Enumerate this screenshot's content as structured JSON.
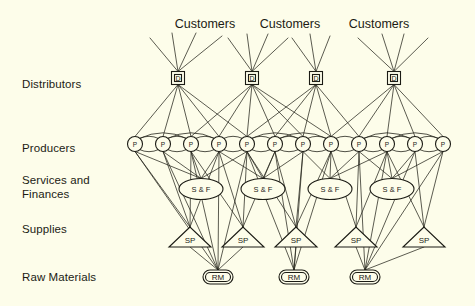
{
  "figure": {
    "background_color": "#fdfdea",
    "ink_color": "#1b1b14",
    "type": "network-diagram",
    "title": ""
  },
  "tier_labels": [
    {
      "id": "distributors",
      "text": "Distributors",
      "x": 22,
      "y": 88
    },
    {
      "id": "producers",
      "text": "Producers",
      "x": 22,
      "y": 152
    },
    {
      "id": "services",
      "text": "Services and",
      "x": 22,
      "y": 184
    },
    {
      "id": "services2",
      "text": "Finances",
      "x": 22,
      "y": 198
    },
    {
      "id": "supplies",
      "text": "Supplies",
      "x": 22,
      "y": 233
    },
    {
      "id": "raw_materials",
      "text": "Raw Materials",
      "x": 22,
      "y": 281
    }
  ],
  "customer_labels": [
    {
      "id": "customers-1",
      "text": "Customers",
      "x": 205,
      "y": 28
    },
    {
      "id": "customers-2",
      "text": "Customers",
      "x": 290,
      "y": 28
    },
    {
      "id": "customers-3",
      "text": "Customers",
      "x": 379,
      "y": 28
    }
  ],
  "nodes": {
    "distributors": {
      "label": "D",
      "shape": "square",
      "y": 78,
      "size": 13,
      "items": [
        {
          "id": "D1",
          "x": 178
        },
        {
          "id": "D2",
          "x": 252
        },
        {
          "id": "D3",
          "x": 316
        },
        {
          "id": "D4",
          "x": 394
        }
      ]
    },
    "producers": {
      "label": "P",
      "shape": "circle",
      "y": 144,
      "r": 7.5,
      "items": [
        {
          "id": "P1",
          "x": 135
        },
        {
          "id": "P2",
          "x": 163
        },
        {
          "id": "P3",
          "x": 191
        },
        {
          "id": "P4",
          "x": 219
        },
        {
          "id": "P5",
          "x": 247
        },
        {
          "id": "P6",
          "x": 275
        },
        {
          "id": "P7",
          "x": 303
        },
        {
          "id": "P8",
          "x": 331
        },
        {
          "id": "P9",
          "x": 359
        },
        {
          "id": "P10",
          "x": 387
        },
        {
          "id": "P11",
          "x": 415
        },
        {
          "id": "P12",
          "x": 443
        }
      ]
    },
    "services_finances": {
      "label": "S & F",
      "shape": "ellipse",
      "y": 189,
      "rx": 22,
      "ry": 10.5,
      "items": [
        {
          "id": "SF1",
          "x": 201
        },
        {
          "id": "SF2",
          "x": 263
        },
        {
          "id": "SF3",
          "x": 330
        },
        {
          "id": "SF4",
          "x": 392
        }
      ]
    },
    "supplies": {
      "label": "SP",
      "shape": "triangle",
      "y": 237,
      "half_width": 21,
      "height": 20,
      "items": [
        {
          "id": "SP1",
          "x": 190
        },
        {
          "id": "SP2",
          "x": 243
        },
        {
          "id": "SP3",
          "x": 296
        },
        {
          "id": "SP4",
          "x": 356
        },
        {
          "id": "SP5",
          "x": 424
        }
      ]
    },
    "raw_materials": {
      "label": "RM",
      "shape": "rounded-rect",
      "y": 277,
      "width": 30,
      "height": 14,
      "items": [
        {
          "id": "RM1",
          "x": 218
        },
        {
          "id": "RM2",
          "x": 294
        },
        {
          "id": "RM3",
          "x": 365
        }
      ]
    }
  },
  "customer_fans": [
    {
      "distributor": "D1",
      "ray_ends": [
        [
          150,
          38
        ],
        [
          172,
          33
        ],
        [
          196,
          33
        ],
        [
          222,
          36
        ]
      ]
    },
    {
      "distributor": "D2",
      "ray_ends": [
        [
          228,
          38
        ],
        [
          247,
          34
        ],
        [
          268,
          34
        ],
        [
          288,
          38
        ]
      ]
    },
    {
      "distributor": "D3",
      "ray_ends": [
        [
          292,
          38
        ],
        [
          310,
          34
        ],
        [
          330,
          36
        ]
      ]
    },
    {
      "distributor": "D4",
      "ray_ends": [
        [
          358,
          38
        ],
        [
          382,
          34
        ],
        [
          404,
          34
        ],
        [
          428,
          38
        ]
      ]
    }
  ],
  "edges": {
    "distributor_to_producer": [
      [
        "D1",
        "P1"
      ],
      [
        "D1",
        "P2"
      ],
      [
        "D1",
        "P3"
      ],
      [
        "D1",
        "P4"
      ],
      [
        "D1",
        "P5"
      ],
      [
        "D2",
        "P3"
      ],
      [
        "D2",
        "P4"
      ],
      [
        "D2",
        "P5"
      ],
      [
        "D2",
        "P6"
      ],
      [
        "D2",
        "P7"
      ],
      [
        "D2",
        "P8"
      ],
      [
        "D3",
        "P5"
      ],
      [
        "D3",
        "P6"
      ],
      [
        "D3",
        "P7"
      ],
      [
        "D3",
        "P8"
      ],
      [
        "D3",
        "P9"
      ],
      [
        "D4",
        "P8"
      ],
      [
        "D4",
        "P9"
      ],
      [
        "D4",
        "P10"
      ],
      [
        "D4",
        "P11"
      ],
      [
        "D4",
        "P12"
      ]
    ],
    "producer_peer_arcs": [
      [
        "P1",
        "P2"
      ],
      [
        "P2",
        "P3"
      ],
      [
        "P3",
        "P4"
      ],
      [
        "P1",
        "P3"
      ],
      [
        "P2",
        "P4"
      ],
      [
        "P4",
        "P5"
      ],
      [
        "P5",
        "P6"
      ],
      [
        "P6",
        "P7"
      ],
      [
        "P7",
        "P8"
      ],
      [
        "P5",
        "P7"
      ],
      [
        "P6",
        "P8"
      ],
      [
        "P8",
        "P9"
      ],
      [
        "P9",
        "P10"
      ],
      [
        "P10",
        "P11"
      ],
      [
        "P11",
        "P12"
      ],
      [
        "P9",
        "P11"
      ],
      [
        "P10",
        "P12"
      ]
    ],
    "producer_to_services": [
      [
        "P1",
        "SF1"
      ],
      [
        "P2",
        "SF1"
      ],
      [
        "P3",
        "SF1"
      ],
      [
        "P4",
        "SF1"
      ],
      [
        "P5",
        "SF1"
      ],
      [
        "P4",
        "SF2"
      ],
      [
        "P5",
        "SF2"
      ],
      [
        "P6",
        "SF2"
      ],
      [
        "P7",
        "SF2"
      ],
      [
        "P7",
        "SF3"
      ],
      [
        "P8",
        "SF3"
      ],
      [
        "P9",
        "SF3"
      ],
      [
        "P10",
        "SF3"
      ],
      [
        "P9",
        "SF4"
      ],
      [
        "P10",
        "SF4"
      ],
      [
        "P11",
        "SF4"
      ],
      [
        "P12",
        "SF4"
      ]
    ],
    "producer_to_supplies": [
      [
        "P1",
        "SP1"
      ],
      [
        "P2",
        "SP1"
      ],
      [
        "P3",
        "SP1"
      ],
      [
        "P4",
        "SP1"
      ],
      [
        "P3",
        "SP2"
      ],
      [
        "P4",
        "SP2"
      ],
      [
        "P5",
        "SP2"
      ],
      [
        "P6",
        "SP2"
      ],
      [
        "P5",
        "SP3"
      ],
      [
        "P6",
        "SP3"
      ],
      [
        "P7",
        "SP3"
      ],
      [
        "P8",
        "SP3"
      ],
      [
        "P8",
        "SP4"
      ],
      [
        "P9",
        "SP4"
      ],
      [
        "P10",
        "SP4"
      ],
      [
        "P10",
        "SP5"
      ],
      [
        "P11",
        "SP5"
      ],
      [
        "P12",
        "SP5"
      ]
    ],
    "producer_to_raw": [
      [
        "P1",
        "RM1"
      ],
      [
        "P2",
        "RM1"
      ],
      [
        "P3",
        "RM1"
      ],
      [
        "P4",
        "RM1"
      ],
      [
        "P5",
        "RM1"
      ],
      [
        "P5",
        "RM2"
      ],
      [
        "P6",
        "RM2"
      ],
      [
        "P7",
        "RM2"
      ],
      [
        "P8",
        "RM2"
      ],
      [
        "P9",
        "RM3"
      ],
      [
        "P10",
        "RM3"
      ],
      [
        "P11",
        "RM3"
      ],
      [
        "P12",
        "RM3"
      ]
    ],
    "supplies_to_raw": [
      [
        "SP1",
        "RM1"
      ],
      [
        "SP2",
        "RM1"
      ],
      [
        "SP3",
        "RM2"
      ],
      [
        "SP4",
        "RM3"
      ],
      [
        "SP5",
        "RM3"
      ]
    ]
  }
}
